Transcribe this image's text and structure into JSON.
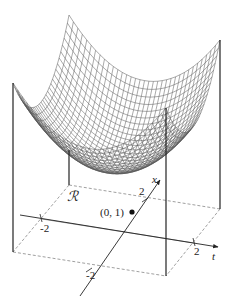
{
  "figure": {
    "surface_color": "#444444",
    "axes": {
      "t_label": "t",
      "x_label": "x",
      "t_ticks": [
        "-2",
        "2"
      ],
      "x_ticks": [
        "-2",
        "2"
      ]
    },
    "region_label": "ℛ",
    "point_label": "(0, 1)"
  }
}
